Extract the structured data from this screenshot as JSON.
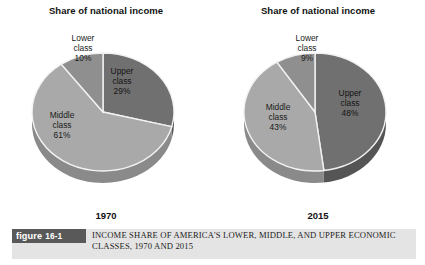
{
  "figure": {
    "badge_word": "figure",
    "badge_number": "16-1",
    "caption": "INCOME SHARE OF AMERICA'S LOWER, MIDDLE, AND UPPER ECONOMIC CLASSES, 1970 AND 2015",
    "badge_color": "#595959",
    "caption_strip_color": "#e4e4e4"
  },
  "colors": {
    "upper_class": "#707070",
    "middle_class": "#a9a9a9",
    "lower_class": "#8f8f8f",
    "depth_upper": "#555555",
    "depth_middle": "#8a8a8a",
    "depth_lower": "#747474",
    "slice_outline": "#f2f2f2",
    "background": "#ffffff"
  },
  "chart_data": [
    {
      "type": "pie",
      "title": "Share of national income",
      "year_label": "1970",
      "categories": [
        "Upper class",
        "Middle class",
        "Lower class"
      ],
      "values": [
        29,
        61,
        10
      ],
      "labels": [
        {
          "name": "Upper class",
          "line1": "Upper",
          "line2": "class",
          "value_text": "29%"
        },
        {
          "name": "Middle class",
          "line1": "Middle",
          "line2": "class",
          "value_text": "61%"
        },
        {
          "name": "Lower class",
          "line1": "Lower",
          "line2": "class",
          "value_text": "10%"
        }
      ],
      "unit": "percent",
      "start_angle_deg": 0,
      "legend": "none"
    },
    {
      "type": "pie",
      "title": "Share of national income",
      "year_label": "2015",
      "categories": [
        "Upper class",
        "Middle class",
        "Lower class"
      ],
      "values": [
        48,
        43,
        9
      ],
      "labels": [
        {
          "name": "Upper class",
          "line1": "Upper",
          "line2": "class",
          "value_text": "48%"
        },
        {
          "name": "Middle class",
          "line1": "Middle",
          "line2": "class",
          "value_text": "43%"
        },
        {
          "name": "Lower class",
          "line1": "Lower",
          "line2": "class",
          "value_text": "9%"
        }
      ],
      "unit": "percent",
      "start_angle_deg": 0,
      "legend": "none"
    }
  ]
}
